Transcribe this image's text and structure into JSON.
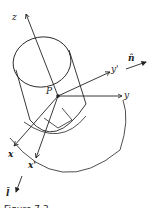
{
  "figure": {
    "caption": "Figure 7.3",
    "labels": {
      "z": "z",
      "y": "y",
      "y_prime": "y'",
      "x": "x",
      "x_prime": "x'",
      "p": "P",
      "n_hat": "n̂",
      "l_hat": "l̂"
    },
    "colors": {
      "stroke": "#222222",
      "background": "#ffffff"
    }
  }
}
